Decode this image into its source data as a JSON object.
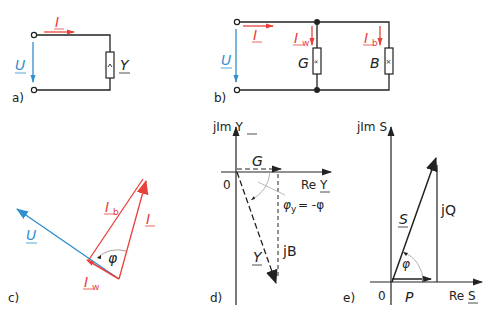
{
  "colors": {
    "current": "#e8413c",
    "voltage": "#2f8fcf",
    "ink": "#222222",
    "arc": "#aaaaaa"
  },
  "panels": {
    "a": {
      "label": "a)",
      "current": "I",
      "voltage": "U",
      "admittance": "Y"
    },
    "b": {
      "label": "b)",
      "current": "I",
      "voltage": "U",
      "branch_w_current": "I",
      "branch_w_sub": "w",
      "branch_b_current": "I",
      "branch_b_sub": "b",
      "conductance": "G",
      "susceptance": "B"
    },
    "c": {
      "label": "c)",
      "voltage": "U",
      "current": "I",
      "ib": "I",
      "ib_sub": "b",
      "iw": "I",
      "iw_sub": "w",
      "angle": "φ"
    },
    "d": {
      "label": "d)",
      "axis_imag": "jIm Y",
      "axis_real": "Re Y",
      "origin": "0",
      "conductance": "G",
      "susceptance": "jB",
      "admittance": "Y",
      "angle": "φ",
      "angle_sub": "y",
      "angle_rhs": "= -φ"
    },
    "e": {
      "label": "e)",
      "axis_imag": "jIm S",
      "axis_real": "Re S",
      "origin": "0",
      "apparent": "S",
      "reactive": "jQ",
      "active": "P",
      "angle": "φ"
    }
  }
}
